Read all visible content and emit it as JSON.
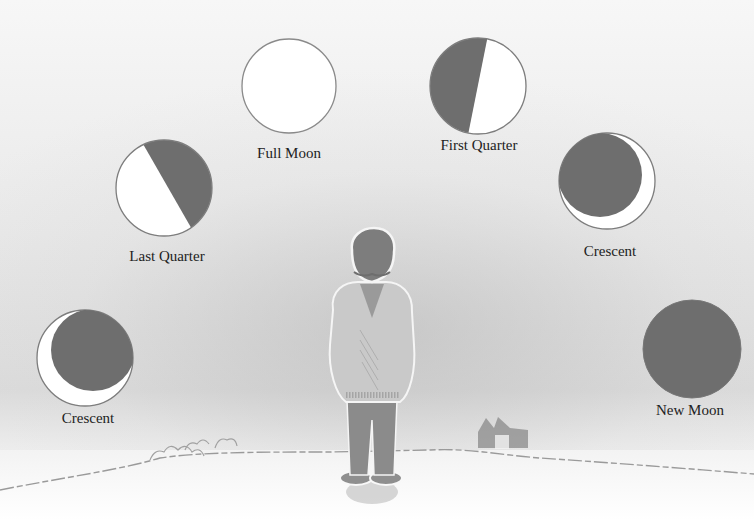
{
  "colors": {
    "moon_light": "#ffffff",
    "moon_dark": "#6e6e6e",
    "outline": "#8a8a8a",
    "label": "#222222"
  },
  "phases": [
    {
      "id": "crescent-waning",
      "label": "Crescent",
      "shading": "dark with thin lit crescent on lower-left"
    },
    {
      "id": "last-quarter",
      "label": "Last Quarter",
      "shading": "right half dark, diagonal terminator"
    },
    {
      "id": "full-moon",
      "label": "Full Moon",
      "shading": "fully lit"
    },
    {
      "id": "first-quarter",
      "label": "First Quarter",
      "shading": "left half dark, diagonal terminator"
    },
    {
      "id": "crescent-waxing",
      "label": "Crescent",
      "shading": "dark with thin lit crescent on lower-right"
    },
    {
      "id": "new-moon",
      "label": "New Moon",
      "shading": "fully dark"
    }
  ],
  "scene": {
    "figure": "child standing on hill, seen from behind",
    "background_elements": [
      "house on horizon",
      "bushes on horizon",
      "hill line"
    ]
  }
}
